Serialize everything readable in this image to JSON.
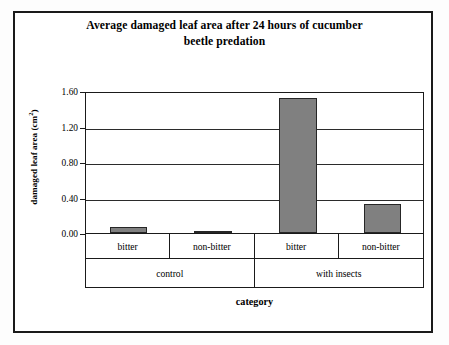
{
  "chart_data": {
    "type": "bar",
    "title": "Average damaged leaf area after 24 hours of cucumber beetle predation",
    "title_line1": "Average damaged leaf area after 24 hours of cucumber",
    "title_line2": "beetle predation",
    "xlabel": "category",
    "ylabel": "damaged leaf area (cm",
    "ylabel_sup": "2",
    "ylabel_suffix": ")",
    "categories": [
      "bitter",
      "non-bitter",
      "bitter",
      "non-bitter"
    ],
    "groups": [
      {
        "label": "control",
        "span": 2
      },
      {
        "label": "with insects",
        "span": 2
      }
    ],
    "values": [
      0.07,
      0.02,
      1.52,
      0.33
    ],
    "ylim": [
      0.0,
      1.6
    ],
    "yticks": [
      0.0,
      0.4,
      0.8,
      1.2,
      1.6
    ],
    "ytick_labels": [
      "0.00",
      "0.40",
      "0.80",
      "1.20",
      "1.60"
    ],
    "grid": true,
    "legend": "none",
    "bar_color": "#808080",
    "bar_border_color": "#262626",
    "axis_color": "#1a1a1a",
    "background": "#ffffff"
  }
}
